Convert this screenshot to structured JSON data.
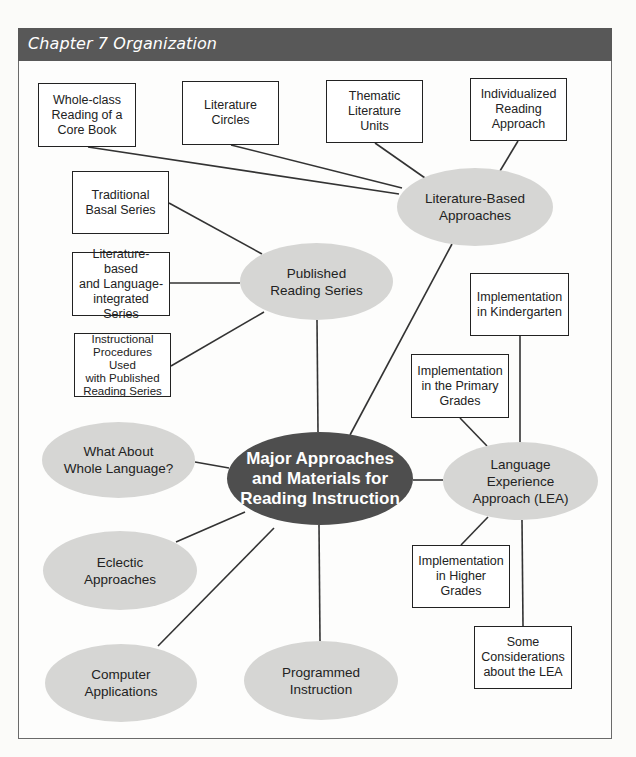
{
  "header": {
    "title": "Chapter 7 Organization"
  },
  "colors": {
    "header_bg": "#585858",
    "header_text": "#ffffff",
    "center_node_bg": "#4e4e4e",
    "oval_bg": "#d6d6d4",
    "box_border": "#222222",
    "line": "#333333"
  },
  "diagram": {
    "center": {
      "label": "Major Approaches\nand Materials for\nReading Instruction"
    },
    "ovals": {
      "literature_based": {
        "label": "Literature-Based\nApproaches"
      },
      "published_series": {
        "label": "Published\nReading Series"
      },
      "lea": {
        "label": "Language\nExperience\nApproach (LEA)"
      },
      "whole_language": {
        "label": "What About\nWhole Language?"
      },
      "eclectic": {
        "label": "Eclectic\nApproaches"
      },
      "computer": {
        "label": "Computer\nApplications"
      },
      "programmed": {
        "label": "Programmed\nInstruction"
      }
    },
    "boxes": {
      "whole_class": {
        "label": "Whole-class\nReading of a\nCore Book"
      },
      "lit_circles": {
        "label": "Literature\nCircles"
      },
      "thematic": {
        "label": "Thematic\nLiterature\nUnits"
      },
      "individualized": {
        "label": "Individualized\nReading\nApproach"
      },
      "traditional_basal": {
        "label": "Traditional\nBasal Series"
      },
      "lit_language_integrated": {
        "label": "Literature-based\nand Language-\nintegrated Series"
      },
      "instructional_procedures": {
        "label": "Instructional\nProcedures Used\nwith Published\nReading Series"
      },
      "kindergarten": {
        "label": "Implementation\nin Kindergarten"
      },
      "primary_grades": {
        "label": "Implementation\nin the Primary\nGrades"
      },
      "higher_grades": {
        "label": "Implementation\nin Higher\nGrades"
      },
      "considerations": {
        "label": "Some\nConsiderations\nabout the LEA"
      }
    }
  }
}
